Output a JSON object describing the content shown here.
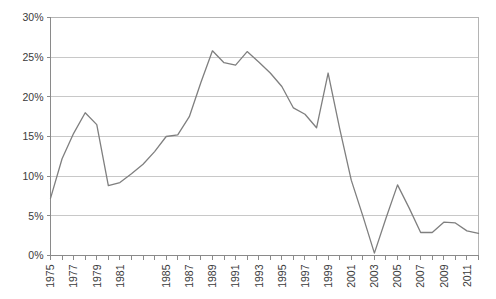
{
  "chart_data": {
    "type": "line",
    "title": "",
    "subtitle": "",
    "xlabel": "",
    "ylabel": "",
    "ylim": [
      0,
      30
    ],
    "ytick_values": [
      0,
      5,
      10,
      15,
      20,
      25,
      30
    ],
    "ytick_labels": [
      "0%",
      "5%",
      "10%",
      "15%",
      "20%",
      "25%",
      "30%"
    ],
    "xlim": [
      1975,
      2012
    ],
    "xtick_labels": [
      "1975",
      "1977",
      "1979",
      "1981",
      "1985",
      "1987",
      "1989",
      "1991",
      "1993",
      "1995",
      "1997",
      "1999",
      "2001",
      "2003",
      "2005",
      "2007",
      "2009",
      "2011"
    ],
    "xtick_label_years": [
      1975,
      1977,
      1979,
      1981,
      1985,
      1987,
      1989,
      1991,
      1993,
      1995,
      1997,
      1999,
      2001,
      2003,
      2005,
      2007,
      2009,
      2011
    ],
    "minor_ticks_every_year": true,
    "grid": "horizontal",
    "legend": "none",
    "line_color": "#7f7f7f",
    "background_color": "#ffffff",
    "grid_color": "#c8c8c8",
    "x": [
      1975,
      1976,
      1977,
      1978,
      1979,
      1980,
      1981,
      1982,
      1983,
      1984,
      1985,
      1986,
      1987,
      1988,
      1989,
      1990,
      1991,
      1992,
      1993,
      1994,
      1995,
      1996,
      1997,
      1998,
      1999,
      2000,
      2001,
      2002,
      2003,
      2004,
      2005,
      2006,
      2007,
      2008,
      2009,
      2010,
      2011,
      2012
    ],
    "values": [
      7.2,
      12.2,
      15.4,
      18.0,
      16.5,
      8.8,
      9.2,
      10.3,
      11.5,
      13.1,
      15.0,
      15.2,
      17.5,
      21.8,
      25.8,
      24.3,
      24.0,
      25.7,
      24.4,
      23.0,
      21.3,
      18.6,
      17.8,
      16.1,
      23.0,
      16.0,
      9.5,
      5.0,
      0.3,
      4.7,
      8.9,
      6.0,
      2.9,
      2.9,
      4.2,
      4.1,
      3.1,
      2.8
    ],
    "series_name": ""
  }
}
